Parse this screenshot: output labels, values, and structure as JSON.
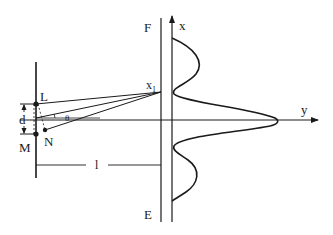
{
  "diagram": {
    "type": "double-slit interference",
    "labels": {
      "slit_top": "L",
      "slit_bottom": "M",
      "path_point": "N",
      "slit_separation": "d",
      "distance": "l",
      "angle": "θ",
      "screen_top": "F",
      "screen_bottom": "E",
      "point_on_screen": "x",
      "point_on_screen_sub": "1",
      "axis_vertical": "x",
      "axis_horizontal": "y"
    },
    "colors": {
      "stroke": "#1a1a1a",
      "background": "#ffffff"
    }
  }
}
